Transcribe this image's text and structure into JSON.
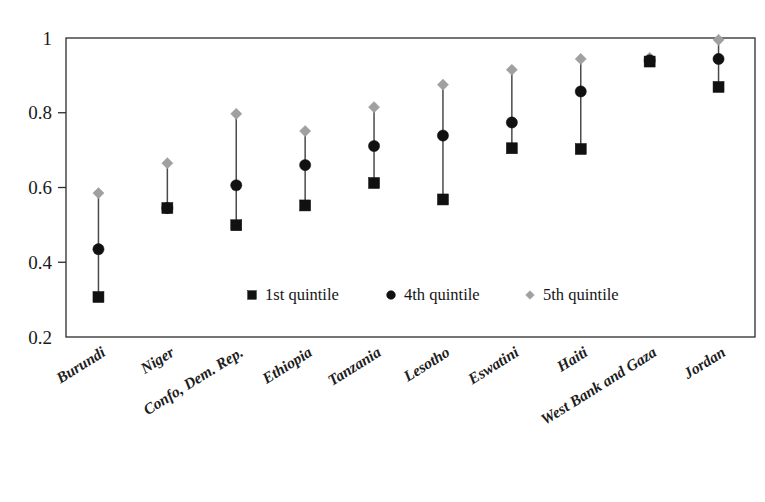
{
  "chart_data": {
    "type": "scatter",
    "title": "",
    "subtitle": "",
    "xlabel": "",
    "ylabel": "",
    "ylim": [
      0.2,
      1.0
    ],
    "ytick_labels": [
      "0.2",
      "0.4",
      "0.6",
      "0.8",
      "1"
    ],
    "ytick_values": [
      0.2,
      0.4,
      0.6,
      0.8,
      1.0
    ],
    "grid": false,
    "legend_position": "inside-bottom-center",
    "categories": [
      "Burundi",
      "Niger",
      "Confo, Dem. Rep.",
      "Ethiopia",
      "Tanzania",
      "Lesotho",
      "Eswatini",
      "Haiti",
      "West Bank and Gaza",
      "Jordan"
    ],
    "series": [
      {
        "name": "1st quintile",
        "marker": "square",
        "color": "#111111",
        "values": [
          0.307,
          0.545,
          0.499,
          0.552,
          0.612,
          0.568,
          0.705,
          0.703,
          0.937,
          0.869
        ]
      },
      {
        "name": "4th quintile",
        "marker": "circle",
        "color": "#111111",
        "values": [
          0.435,
          0.545,
          0.606,
          0.66,
          0.711,
          0.739,
          0.774,
          0.857,
          0.94,
          0.944
        ]
      },
      {
        "name": "5th quintile",
        "marker": "diamond",
        "color": "#a0a0a0",
        "values": [
          0.585,
          0.665,
          0.797,
          0.751,
          0.815,
          0.875,
          0.915,
          0.944,
          0.947,
          0.995
        ]
      }
    ]
  },
  "legend": {
    "entries": [
      {
        "label": "1st quintile",
        "marker": "square-marker-icon",
        "color": "#111111"
      },
      {
        "label": "4th quintile",
        "marker": "circle-marker-icon",
        "color": "#111111"
      },
      {
        "label": "5th quintile",
        "marker": "diamond-marker-icon",
        "color": "#a0a0a0"
      }
    ]
  },
  "colors": {
    "axis": "#2b2b2b",
    "connector": "#4a4a4a",
    "dark_marker": "#111111",
    "light_marker": "#a0a0a0",
    "background": "#ffffff"
  }
}
